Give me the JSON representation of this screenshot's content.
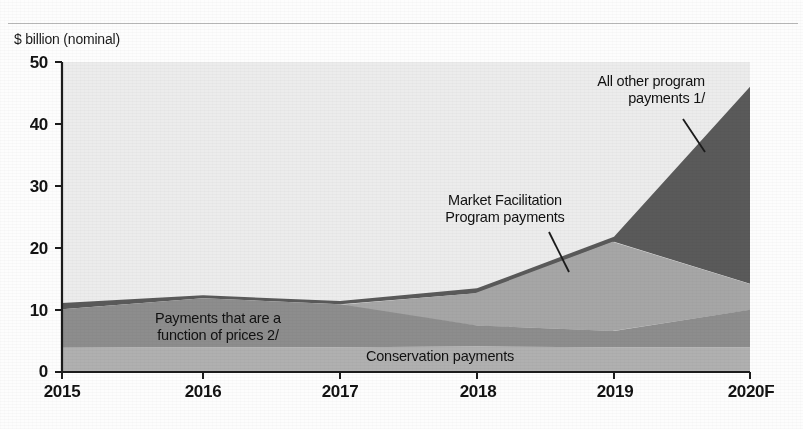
{
  "figure": {
    "y_axis_title": "$ billion (nominal)",
    "y_ticks": [
      "50",
      "40",
      "30",
      "20",
      "10",
      "0"
    ],
    "x_ticks": [
      "2015",
      "2016",
      "2017",
      "2018",
      "2019",
      "2020F"
    ],
    "annotations": {
      "all_other": "All other program\npayments 1/",
      "mfp": "Market Facilitation\nProgram payments",
      "prices": "Payments that are a\nfunction of prices 2/",
      "conservation": "Conservation payments"
    },
    "colors": {
      "conservation": "#b0b0b0",
      "prices": "#8e8e8e",
      "mfp": "#a6a6a6",
      "all_other": "#585858",
      "plot_background": "#ebebeb",
      "axis": "#1b1b1b"
    }
  },
  "chart_data": {
    "type": "area",
    "stacked": true,
    "title": "",
    "xlabel": "",
    "ylabel": "$ billion (nominal)",
    "ylim": [
      0,
      50
    ],
    "xlim": [
      "2015",
      "2020F"
    ],
    "grid": false,
    "legend": "inline-annotations",
    "categories": [
      "2015",
      "2016",
      "2017",
      "2018",
      "2019",
      "2020F"
    ],
    "series": [
      {
        "name": "Conservation payments",
        "color": "#b0b0b0",
        "values": [
          3.9,
          4.0,
          4.0,
          4.1,
          4.0,
          4.0
        ]
      },
      {
        "name": "Payments that are a function of prices 2/",
        "color": "#8e8e8e",
        "values": [
          6.1,
          7.9,
          6.8,
          3.4,
          2.6,
          6.0
        ]
      },
      {
        "name": "Market Facilitation Program payments",
        "color": "#a6a6a6",
        "values": [
          0.0,
          0.0,
          0.0,
          5.2,
          14.4,
          4.2
        ]
      },
      {
        "name": "All other program payments 1/",
        "color": "#585858",
        "values": [
          1.0,
          0.5,
          0.5,
          0.8,
          0.8,
          31.8
        ]
      }
    ],
    "totals": [
      11.0,
      12.4,
      11.3,
      13.5,
      21.8,
      46.0
    ],
    "annotations": [
      {
        "text": "All other program payments 1/",
        "series": "All other program payments 1/"
      },
      {
        "text": "Market Facilitation Program payments",
        "series": "Market Facilitation Program payments"
      },
      {
        "text": "Payments that are a function of prices 2/",
        "series": "Payments that are a function of prices 2/"
      },
      {
        "text": "Conservation payments",
        "series": "Conservation payments"
      }
    ]
  }
}
